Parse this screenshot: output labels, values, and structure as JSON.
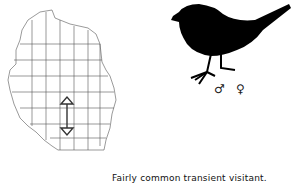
{
  "map": {
    "region": "Wisconsin",
    "marker": "double-headed vertical arrow"
  },
  "symbols": {
    "male": "♂",
    "female": "♀"
  },
  "caption": "Fairly common transient visitant."
}
